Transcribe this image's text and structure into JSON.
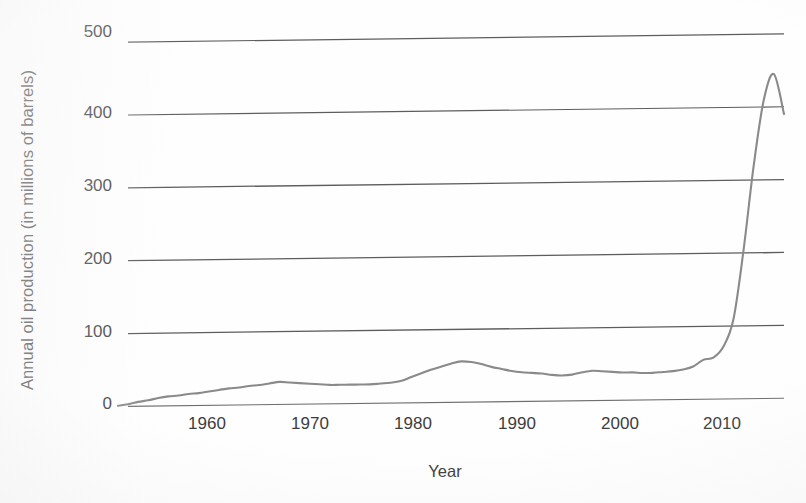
{
  "chart_data": {
    "type": "line",
    "title": "",
    "xlabel": "Year",
    "ylabel": "Annual oil production (in millions of barrels)",
    "xlim": [
      1950,
      2016
    ],
    "ylim": [
      0,
      510
    ],
    "grid": true,
    "legend": false,
    "line_color": "#8a8a8a",
    "grid_color": "#5a5a5a",
    "axis_text_color": "#3d3d3d",
    "y_ticks": [
      0,
      100,
      200,
      300,
      400,
      500
    ],
    "y_tick_labels": [
      "0",
      "100",
      "200",
      "300",
      "400",
      "500"
    ],
    "x_ticks": [
      1960,
      1970,
      1980,
      1990,
      2000,
      2010
    ],
    "x_tick_labels": [
      "1960",
      "1970",
      "1980",
      "1990",
      "2000",
      "2010"
    ],
    "x": [
      1950,
      1951,
      1952,
      1953,
      1954,
      1955,
      1956,
      1957,
      1958,
      1959,
      1960,
      1961,
      1962,
      1963,
      1964,
      1965,
      1966,
      1967,
      1968,
      1969,
      1970,
      1971,
      1972,
      1973,
      1974,
      1975,
      1976,
      1977,
      1978,
      1979,
      1980,
      1981,
      1982,
      1983,
      1984,
      1985,
      1986,
      1987,
      1988,
      1989,
      1990,
      1991,
      1992,
      1993,
      1994,
      1995,
      1996,
      1997,
      1998,
      1999,
      2000,
      2001,
      2002,
      2003,
      2004,
      2005,
      2006,
      2007,
      2008,
      2009,
      2010,
      2011,
      2012,
      2013,
      2014,
      2015,
      2016
    ],
    "values": [
      1,
      3,
      6,
      8,
      11,
      13,
      14,
      16,
      17,
      19,
      21,
      23,
      24,
      26,
      27,
      29,
      31,
      30,
      29,
      28,
      27,
      26,
      26,
      26,
      26,
      26,
      27,
      28,
      30,
      35,
      40,
      45,
      49,
      53,
      56,
      55,
      52,
      48,
      45,
      42,
      40,
      39,
      38,
      36,
      35,
      36,
      39,
      41,
      40,
      39,
      38,
      38,
      37,
      37,
      38,
      39,
      41,
      45,
      54,
      57,
      72,
      110,
      205,
      320,
      410,
      445,
      390
    ],
    "series_name": "Annual oil production"
  },
  "axis": {
    "y_title": "Annual oil production (in millions of barrels)",
    "x_title": "Year"
  }
}
